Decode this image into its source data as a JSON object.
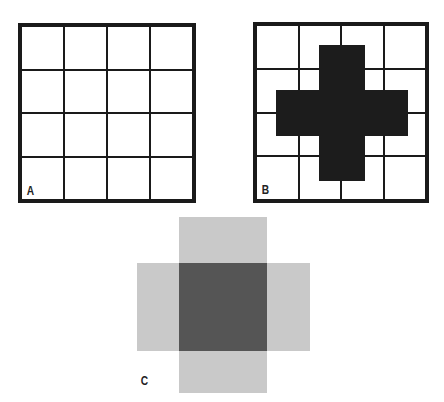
{
  "figure": {
    "panels": [
      {
        "id": "A",
        "label": "A",
        "description": "Empty 4x4 grid",
        "rows": 4,
        "cols": 4
      },
      {
        "id": "B",
        "label": "B",
        "description": "4x4 grid with black cross overlay",
        "rows": 4,
        "cols": 4,
        "fill_color": "#1a1a1a"
      },
      {
        "id": "C",
        "label": "C",
        "description": "Blurred cross: dark center square with light gray arms",
        "center_color": "#555555",
        "arm_color": "#c9c9c9"
      }
    ]
  }
}
